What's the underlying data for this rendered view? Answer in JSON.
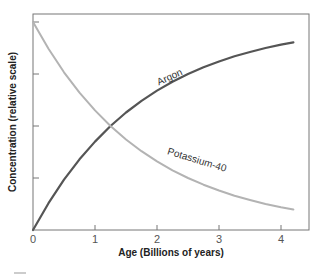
{
  "chart_data": {
    "type": "line",
    "title": "",
    "xlabel": "Age (Billions of years)",
    "ylabel": "Concentration (relative scale)",
    "xlim": [
      0,
      4.45
    ],
    "ylim": [
      0,
      1.04
    ],
    "x_ticks": [
      0,
      1,
      2,
      3,
      4
    ],
    "x_tick_labels": [
      "0",
      "1",
      "2",
      "3",
      "4"
    ],
    "y_ticks": [
      0,
      0.25,
      0.5,
      0.75,
      1.0
    ],
    "y_tick_labels": [
      "",
      "",
      "",
      "",
      ""
    ],
    "grid": false,
    "legend": "inline labels",
    "x": [
      0,
      0.25,
      0.5,
      0.75,
      1.0,
      1.25,
      1.5,
      1.75,
      2.0,
      2.25,
      2.5,
      2.75,
      3.0,
      3.25,
      3.5,
      3.75,
      4.0,
      4.2
    ],
    "series": [
      {
        "name": "Argon",
        "color": "#555555",
        "values": [
          0.0,
          0.129,
          0.242,
          0.34,
          0.425,
          0.5,
          0.565,
          0.621,
          0.67,
          0.713,
          0.75,
          0.782,
          0.81,
          0.835,
          0.856,
          0.875,
          0.891,
          0.902
        ]
      },
      {
        "name": "Potassium-40",
        "color": "#b3b3b3",
        "values": [
          1.0,
          0.871,
          0.758,
          0.66,
          0.575,
          0.5,
          0.435,
          0.379,
          0.33,
          0.287,
          0.25,
          0.218,
          0.19,
          0.165,
          0.144,
          0.125,
          0.109,
          0.098
        ]
      }
    ],
    "annotations": [
      {
        "text": "Argon",
        "x": 2.0,
        "y": 0.75,
        "series": "Argon"
      },
      {
        "text": "Potassium-40",
        "x": 2.5,
        "y": 0.34,
        "series": "Potassium-40"
      }
    ]
  }
}
